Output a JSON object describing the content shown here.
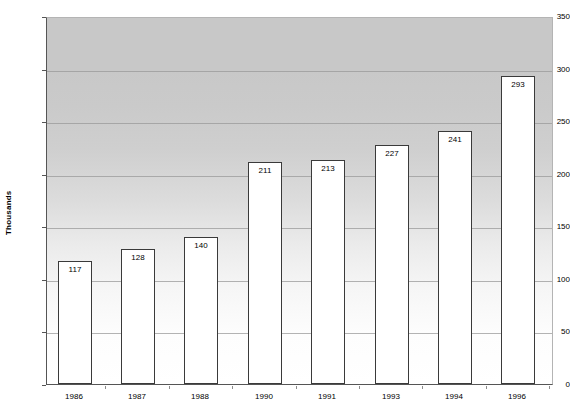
{
  "chart_data": {
    "type": "bar",
    "title": "",
    "xlabel": "",
    "ylabel": "Thousands",
    "categories": [
      "1986",
      "1987",
      "1988",
      "1990",
      "1991",
      "1993",
      "1994",
      "1996"
    ],
    "values": [
      117,
      128,
      140,
      211,
      213,
      227,
      241,
      293
    ],
    "data_labels": [
      "117",
      "128",
      "140",
      "211",
      "213",
      "227",
      "241",
      "293"
    ],
    "ylim": [
      0,
      350
    ],
    "yticks": [
      0,
      50,
      100,
      150,
      200,
      250,
      300,
      350
    ],
    "ytick_labels": [
      "0",
      "50",
      "100",
      "150",
      "200",
      "250",
      "300",
      "350"
    ],
    "grid": true,
    "grid_axis": "y",
    "legend": false,
    "legend_position": "none",
    "bar_fill_color": "#ffffff",
    "bar_border_color": "#3a3a3a",
    "plot_background": "gradient-gray-to-white",
    "axis_color": "#555555"
  }
}
